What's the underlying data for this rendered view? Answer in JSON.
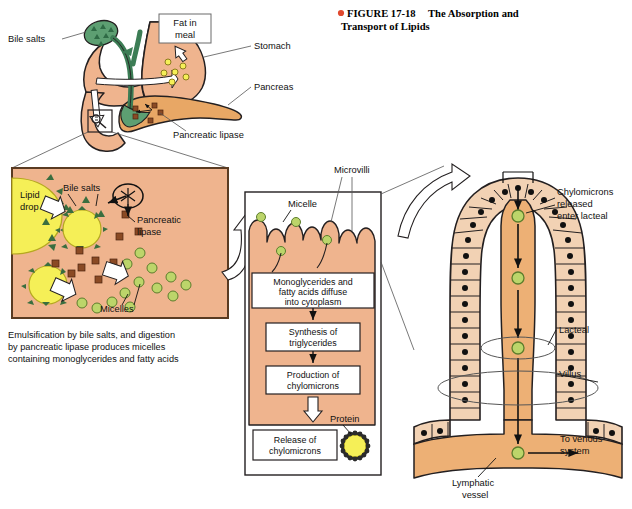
{
  "figure": {
    "bullet_color": "#e1492e",
    "number_label": "FIGURE 17-18",
    "title_line1": "The Absorption and",
    "title_line2": "Transport of Lipids"
  },
  "colors": {
    "tissue_tan": "#efb48e",
    "pancreas_orange": "#e8a765",
    "epithelium_peach": "#f2d2b4",
    "lipid_yellow": "#f5ef57",
    "micelle_green": "#bcd56a",
    "bile_green": "#5d9f72",
    "lipase_brown": "#8a4a24",
    "outline": "#231f20",
    "lacteal_tan": "#edb075"
  },
  "panel_overview": {
    "name": "Overview of fat digestion",
    "labels": [
      {
        "id": "bile-salts",
        "text": "Bile salts"
      },
      {
        "id": "fat-in-meal",
        "line1": "Fat in",
        "line2": "meal"
      },
      {
        "id": "stomach",
        "text": "Stomach"
      },
      {
        "id": "pancreas",
        "text": "Pancreas"
      },
      {
        "id": "pancreatic-lipase",
        "text": "Pancreatic lipase"
      }
    ]
  },
  "panel_emulsification": {
    "name": "Emulsification detail box",
    "labels": [
      {
        "id": "lipid-drop",
        "line1": "Lipid",
        "line2": "drop"
      },
      {
        "id": "bile-salts",
        "text": "Bile salts"
      },
      {
        "id": "pancreatic-lipase",
        "line1": "Pancreatic",
        "line2": "lipase"
      },
      {
        "id": "micelles",
        "text": "Micelles"
      }
    ],
    "caption_line1": "Emulsification by bile salts, and digestion",
    "caption_line2": "by pancreatic lipase produces micelles",
    "caption_line3": "containing monoglycerides and fatty acids"
  },
  "panel_epithelial": {
    "name": "Intestinal epithelial cell panel",
    "labels": [
      {
        "id": "micelle",
        "text": "Micelle"
      },
      {
        "id": "microvilli",
        "text": "Microvilli"
      },
      {
        "id": "protein",
        "text": "Protein"
      }
    ],
    "flow_steps": [
      {
        "id": "step-diffuse",
        "line1": "Monoglycerides and",
        "line2": "fatty acids diffuse",
        "line3": "into cytoplasm"
      },
      {
        "id": "step-synthesis",
        "line1": "Synthesis of",
        "line2": "triglycerides"
      },
      {
        "id": "step-production",
        "line1": "Production of",
        "line2": "chylomicrons"
      },
      {
        "id": "step-release",
        "line1": "Release of",
        "line2": "chylomicrons"
      }
    ]
  },
  "panel_villus": {
    "name": "Villus and lacteal panel",
    "labels": [
      {
        "id": "chylomicrons-released",
        "line1": "Chylomicrons",
        "line2": "released",
        "line3": "enter lacteal"
      },
      {
        "id": "lacteal",
        "text": "Lacteal"
      },
      {
        "id": "villus",
        "text": "Villus"
      },
      {
        "id": "to-venous-system",
        "line1": "To venous",
        "line2": "system"
      },
      {
        "id": "lymphatic-vessel",
        "line1": "Lymphatic",
        "line2": "vessel"
      }
    ]
  }
}
